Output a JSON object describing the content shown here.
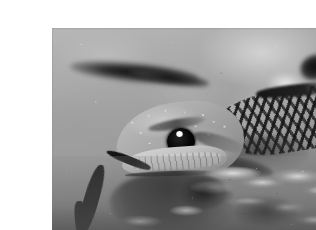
{
  "image": {
    "title": "Rattlesnake head close-up",
    "subject": "rattlesnake",
    "alt_text": "Close-up grayscale photograph of a rattlesnake's head resting on sandy gravel ground, with its forked tongue extended downward and its dark diamond-patterned body trailing off to the right.",
    "medium": "photograph",
    "color_mode": "grayscale",
    "orientation": "landscape",
    "canvas_width": 316,
    "canvas_height": 230,
    "photo_width": 292,
    "photo_height": 206,
    "border_width": 12,
    "border_color": "#ffffff"
  },
  "palette": {
    "border": "#ffffff",
    "sand_light": "#cfcfcf",
    "sand_mid": "#a6a6a6",
    "sand_dark": "#7c7c7c",
    "scale_highlight": "#dedede",
    "pattern_dark": "#1a1a1a",
    "shadow": "#0c0c0c",
    "eye_black": "#000000",
    "catchlight": "#ffffff"
  },
  "scene": {
    "background": {
      "name": "blurred sandy ground",
      "description": "Out-of-focus sunlit sand and fine gravel filling the upper two thirds of the frame."
    },
    "elements": [
      {
        "name": "blurred-twig",
        "label": "Out-of-focus dark twig",
        "position": "upper left",
        "tone": "dark"
      },
      {
        "name": "blurred-blob-upper-right",
        "label": "Out-of-focus dark blobs",
        "position": "upper right",
        "tone": "dark"
      },
      {
        "name": "snake-head",
        "label": "Rattlesnake head",
        "position": "center left",
        "tone": "mid-gray",
        "detail": "Bumpy keeled scales across the crown, pale upper labial scales along the snout."
      },
      {
        "name": "snake-eye",
        "label": "Eye with catchlight",
        "position": "center",
        "tone": "black",
        "detail": "Large round dark eye with a single bright specular highlight."
      },
      {
        "name": "forked-tongue",
        "label": "Extended forked tongue",
        "position": "lower left of the snout",
        "tone": "black",
        "detail": "Thin dark tongue curving down and to the left, splitting into a fork."
      },
      {
        "name": "snake-body",
        "label": "Patterned body and neck",
        "position": "right",
        "tone": "mid-gray with dark bands",
        "detail": "Checkered dark diamond banding running back from the head toward the right edge."
      },
      {
        "name": "head-shadow",
        "label": "Shadow beneath the head",
        "position": "lower center left",
        "tone": "black"
      },
      {
        "name": "gravel-foreground",
        "label": "Rocky gravel foreground",
        "position": "bottom right",
        "tone": "mixed light and dark pebbles"
      }
    ]
  }
}
